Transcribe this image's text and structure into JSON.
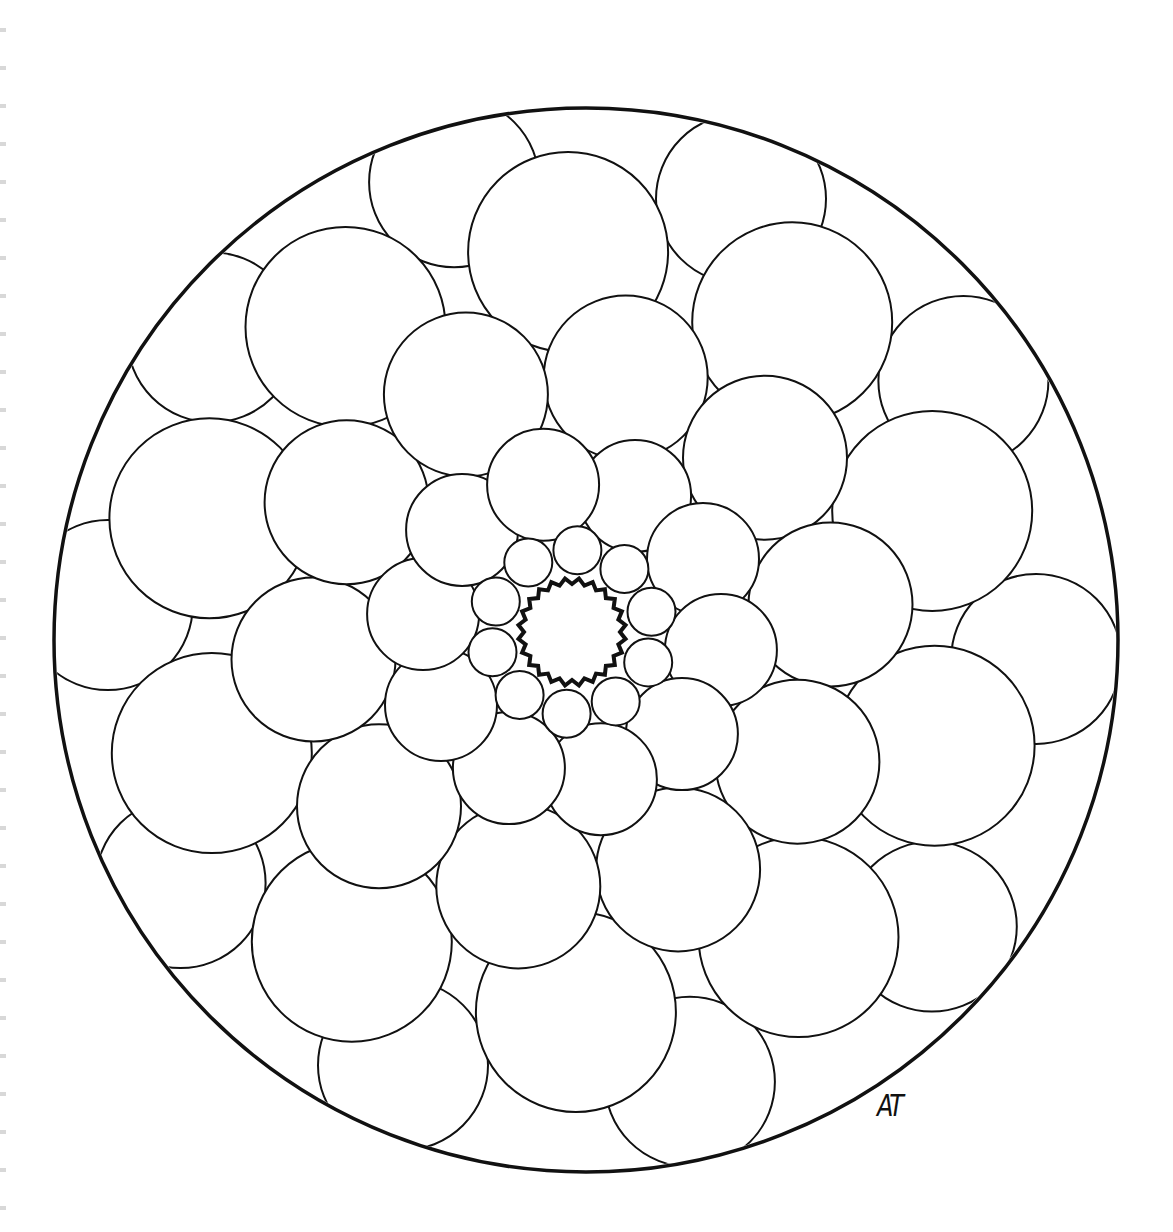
{
  "page": {
    "signature": "AT"
  },
  "colors": {
    "stroke": "#111111",
    "background": "#ffffff",
    "binding": "#d8d8d8"
  },
  "mandala": {
    "outer_circle": {
      "cx": 586,
      "cy": 640,
      "r": 532
    },
    "center": {
      "cx": 572,
      "cy": 632,
      "r": 50,
      "scallops": 24
    },
    "rings": [
      {
        "name": "ring-1",
        "count": 10,
        "dist": 82,
        "r": 24,
        "phase": 0
      },
      {
        "name": "ring-2",
        "count": 10,
        "dist": 150,
        "r": 56,
        "phase": 18
      },
      {
        "name": "ring-3",
        "count": 10,
        "dist": 260,
        "r": 82,
        "phase": 0
      },
      {
        "name": "ring-4",
        "count": 10,
        "dist": 380,
        "r": 100,
        "phase": 18
      },
      {
        "name": "ring-5",
        "count": 10,
        "dist": 465,
        "r": 85,
        "phase": 0
      }
    ]
  }
}
